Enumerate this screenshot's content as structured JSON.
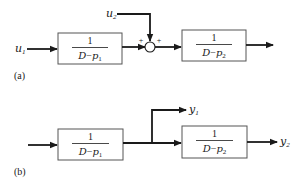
{
  "diagram_a": {
    "label": "(a)",
    "input_1": {
      "symbol": "u",
      "subscript": "1"
    },
    "input_2": {
      "symbol": "u",
      "subscript": "2"
    },
    "block_1": {
      "numerator": "1",
      "denominator_var": "D",
      "denominator_op": "−",
      "denominator_pole": "p",
      "denominator_sub": "1"
    },
    "block_2": {
      "numerator": "1",
      "denominator_var": "D",
      "denominator_op": "−",
      "denominator_pole": "p",
      "denominator_sub": "2"
    },
    "summing_junction": {
      "sign_left": "+",
      "sign_right": "+"
    }
  },
  "diagram_b": {
    "label": "(b)",
    "output_1": {
      "symbol": "y",
      "subscript": "1"
    },
    "output_2": {
      "symbol": "y",
      "subscript": "2"
    },
    "block_1": {
      "numerator": "1",
      "denominator_var": "D",
      "denominator_op": "−",
      "denominator_pole": "p",
      "denominator_sub": "1"
    },
    "block_2": {
      "numerator": "1",
      "denominator_var": "D",
      "denominator_op": "−",
      "denominator_pole": "p",
      "denominator_sub": "2"
    }
  },
  "colors": {
    "stroke": "#1a1a1a",
    "background": "#ffffff",
    "box_border": "#555555"
  }
}
